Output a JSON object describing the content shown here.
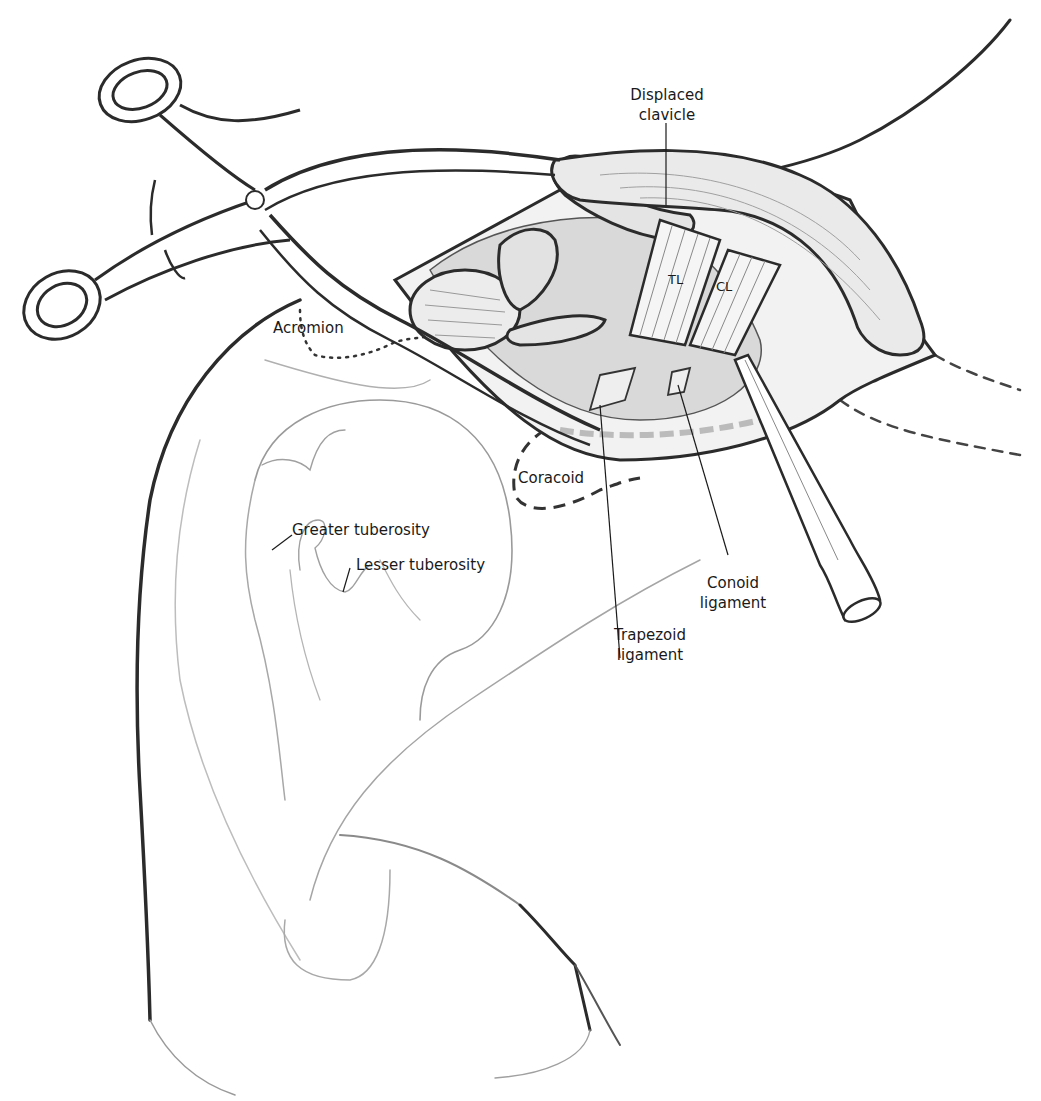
{
  "figure": {
    "type": "surgical-illustration",
    "colors": {
      "background": "#ffffff",
      "ink_dark": "#2b2b2b",
      "ink_light": "#9a9a9a",
      "shading": "#d8d8d8",
      "label_text": "#1a1a1a"
    }
  },
  "labels": {
    "displaced_clavicle": {
      "line1": "Displaced",
      "line2": "clavicle"
    },
    "tl": "TL",
    "cl": "CL",
    "acromion": "Acromion",
    "coracoid": "Coracoid",
    "greater_tuberosity": "Greater tuberosity",
    "lesser_tuberosity": "Lesser tuberosity",
    "conoid_ligament": {
      "line1": "Conoid",
      "line2": "ligament"
    },
    "trapezoid_ligament": {
      "line1": "Trapezoid",
      "line2": "ligament"
    }
  },
  "icons": {
    "retractor": "self-retaining-retractor-icon",
    "elevator": "periosteal-elevator-icon"
  }
}
